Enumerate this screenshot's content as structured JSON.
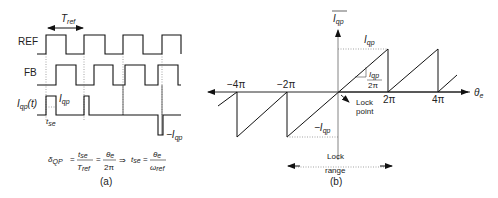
{
  "panel_a": {
    "caption": "(a)",
    "period_label": "T",
    "period_sub": "ref",
    "signals": [
      {
        "name": "REF",
        "label": "REF"
      },
      {
        "name": "FB",
        "label": "FB"
      },
      {
        "name": "Iqp",
        "label": "I",
        "label_sub": "qp",
        "label_suffix": "(t)"
      }
    ],
    "pulse_label": "I",
    "pulse_sub": "qp",
    "neg_pulse_label": "−I",
    "neg_pulse_sub": "qp",
    "tse_label": "t",
    "tse_sub": "se",
    "equation": {
      "lhs": "δ",
      "lhs_sub": "QP",
      "f1_num": "t",
      "f1_num_sub": "se",
      "f1_den": "T",
      "f1_den_sub": "ref",
      "f2_num": "θ",
      "f2_num_sub": "e",
      "f2_den": "2π",
      "implies": "⇒",
      "rhs": "t",
      "rhs_sub": "se",
      "f3_num": "θ",
      "f3_num_sub": "e",
      "f3_den": "ω",
      "f3_den_sub": "ref",
      "eq": "="
    }
  },
  "panel_b": {
    "caption": "(b)",
    "y_axis_label": "I",
    "y_axis_sub": "qp",
    "x_axis_label": "θ",
    "x_axis_sub": "e",
    "ticks": [
      "−4π",
      "−2π",
      "2π",
      "4π"
    ],
    "top_label": "I",
    "top_sub": "qp",
    "bottom_label": "−I",
    "bottom_sub": "qp",
    "slope_num": "I",
    "slope_num_sub": "qp",
    "slope_den": "2π",
    "lock_point": [
      "Lock",
      "point"
    ],
    "lock_range": [
      "Lock",
      "range"
    ]
  }
}
